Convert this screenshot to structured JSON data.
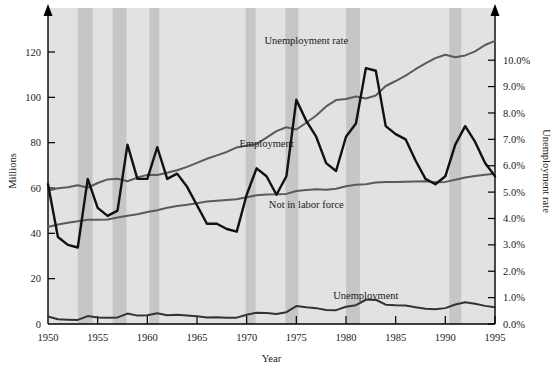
{
  "chart_data": {
    "type": "line",
    "title": "",
    "xlabel": "Year",
    "ylabel": "Millions",
    "y2label": "Unemployment rate",
    "xlim": [
      1950,
      1995
    ],
    "ylim": [
      0,
      135
    ],
    "y2lim": [
      0.0,
      11.6
    ],
    "grid": false,
    "legend": "inline-annotations",
    "xticks": [
      "1950",
      "1955",
      "1960",
      "1965",
      "1970",
      "1975",
      "1980",
      "1985",
      "1990",
      "1995"
    ],
    "xtick_values": [
      1950,
      1955,
      1960,
      1965,
      1970,
      1975,
      1980,
      1985,
      1990,
      1995
    ],
    "yticks": [
      "0",
      "20",
      "40",
      "60",
      "80",
      "100",
      "120"
    ],
    "ytick_values": [
      0,
      20,
      40,
      60,
      80,
      100,
      120
    ],
    "y2ticks": [
      "0.0%",
      "1.0%",
      "2.0%",
      "3.0%",
      "4.0%",
      "5.0%",
      "6.0%",
      "7.0%",
      "8.0%",
      "9.0%",
      "10.0%"
    ],
    "y2tick_values": [
      0,
      1,
      2,
      3,
      4,
      5,
      6,
      7,
      8,
      9,
      10
    ],
    "plot_bg": "#e2e2e2",
    "recession_band_color": "#c6c6c6",
    "series": [
      {
        "name": "Employment",
        "axis": "left",
        "color": "#5a5a5a",
        "label_x": 1972,
        "label_y": 78,
        "x": [
          1950,
          1951,
          1952,
          1953,
          1954,
          1955,
          1956,
          1957,
          1958,
          1959,
          1960,
          1961,
          1962,
          1963,
          1964,
          1965,
          1966,
          1967,
          1968,
          1969,
          1970,
          1971,
          1972,
          1973,
          1974,
          1975,
          1976,
          1977,
          1978,
          1979,
          1980,
          1981,
          1982,
          1983,
          1984,
          1985,
          1986,
          1987,
          1988,
          1989,
          1990,
          1991,
          1992,
          1993,
          1994,
          1995
        ],
        "values": [
          58.9,
          59.9,
          60.3,
          61.2,
          60.1,
          62.2,
          63.8,
          64.1,
          63.0,
          64.6,
          65.8,
          65.7,
          66.7,
          67.8,
          69.3,
          71.1,
          72.9,
          74.4,
          75.9,
          77.9,
          78.7,
          79.4,
          82.2,
          85.1,
          86.8,
          85.8,
          88.8,
          92.0,
          96.0,
          98.8,
          99.3,
          100.4,
          99.5,
          100.8,
          105.0,
          107.2,
          109.6,
          112.4,
          115.0,
          117.3,
          118.8,
          117.7,
          118.5,
          120.3,
          123.1,
          124.9
        ]
      },
      {
        "name": "Not in labor force",
        "axis": "left",
        "color": "#5a5a5a",
        "label_x": 1976,
        "label_y": 51,
        "x": [
          1950,
          1951,
          1952,
          1953,
          1954,
          1955,
          1956,
          1957,
          1958,
          1959,
          1960,
          1961,
          1962,
          1963,
          1964,
          1965,
          1966,
          1967,
          1968,
          1969,
          1970,
          1971,
          1972,
          1973,
          1974,
          1975,
          1976,
          1977,
          1978,
          1979,
          1980,
          1981,
          1982,
          1983,
          1984,
          1985,
          1986,
          1987,
          1988,
          1989,
          1990,
          1991,
          1992,
          1993,
          1994,
          1995
        ],
        "values": [
          42.8,
          43.9,
          44.7,
          45.3,
          46.0,
          46.0,
          46.1,
          47.0,
          47.8,
          48.4,
          49.4,
          50.2,
          51.3,
          52.1,
          52.6,
          53.3,
          54.0,
          54.4,
          54.7,
          55.0,
          55.9,
          56.8,
          57.1,
          57.2,
          57.4,
          58.7,
          59.1,
          59.4,
          59.2,
          59.7,
          60.8,
          61.4,
          61.7,
          62.4,
          62.6,
          62.7,
          62.8,
          62.9,
          63.0,
          62.5,
          62.7,
          63.6,
          64.6,
          65.3,
          65.8,
          66.3
        ]
      },
      {
        "name": "Unemployment",
        "axis": "left",
        "color": "#333333",
        "label_x": 1982,
        "label_y": 11,
        "x": [
          1950,
          1951,
          1952,
          1953,
          1954,
          1955,
          1956,
          1957,
          1958,
          1959,
          1960,
          1961,
          1962,
          1963,
          1964,
          1965,
          1966,
          1967,
          1968,
          1969,
          1970,
          1971,
          1972,
          1973,
          1974,
          1975,
          1976,
          1977,
          1978,
          1979,
          1980,
          1981,
          1982,
          1983,
          1984,
          1985,
          1986,
          1987,
          1988,
          1989,
          1990,
          1991,
          1992,
          1993,
          1994,
          1995
        ],
        "values": [
          3.3,
          2.1,
          1.9,
          1.8,
          3.5,
          2.9,
          2.8,
          2.9,
          4.6,
          3.7,
          3.9,
          4.7,
          3.9,
          4.1,
          3.8,
          3.4,
          2.9,
          3.0,
          2.8,
          2.8,
          4.1,
          5.0,
          4.9,
          4.4,
          5.2,
          7.9,
          7.4,
          7.0,
          6.2,
          6.1,
          7.6,
          8.3,
          10.7,
          10.7,
          8.5,
          8.3,
          8.2,
          7.4,
          6.7,
          6.5,
          7.0,
          8.6,
          9.6,
          8.9,
          8.0,
          7.4
        ]
      },
      {
        "name": "Unemployment rate",
        "axis": "right",
        "color": "#111111",
        "label_x": 1976,
        "label_y_pct": 10.6,
        "x": [
          1950,
          1951,
          1952,
          1953,
          1954,
          1955,
          1956,
          1957,
          1958,
          1959,
          1960,
          1961,
          1962,
          1963,
          1964,
          1965,
          1966,
          1967,
          1968,
          1969,
          1970,
          1971,
          1972,
          1973,
          1974,
          1975,
          1976,
          1977,
          1978,
          1979,
          1980,
          1981,
          1982,
          1983,
          1984,
          1985,
          1986,
          1987,
          1988,
          1989,
          1990,
          1991,
          1992,
          1993,
          1994,
          1995
        ],
        "values": [
          5.3,
          3.3,
          3.0,
          2.9,
          5.5,
          4.4,
          4.1,
          4.3,
          6.8,
          5.5,
          5.5,
          6.7,
          5.5,
          5.7,
          5.2,
          4.5,
          3.8,
          3.8,
          3.6,
          3.5,
          4.9,
          5.9,
          5.6,
          4.9,
          5.6,
          8.5,
          7.7,
          7.1,
          6.1,
          5.8,
          7.1,
          7.6,
          9.7,
          9.6,
          7.5,
          7.2,
          7.0,
          6.2,
          5.5,
          5.3,
          5.6,
          6.8,
          7.5,
          6.9,
          6.1,
          5.6
        ]
      }
    ],
    "recessions": [
      {
        "start": 1953.0,
        "end": 1954.5
      },
      {
        "start": 1956.5,
        "end": 1957.9
      },
      {
        "start": 1960.2,
        "end": 1961.2
      },
      {
        "start": 1969.9,
        "end": 1970.9
      },
      {
        "start": 1973.9,
        "end": 1975.2
      },
      {
        "start": 1980.0,
        "end": 1981.4
      },
      {
        "start": 1990.4,
        "end": 1991.6
      }
    ]
  }
}
